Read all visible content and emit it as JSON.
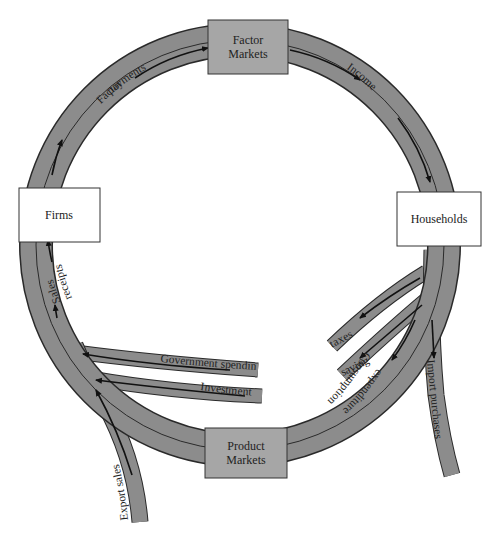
{
  "diagram": {
    "type": "circular-flow",
    "colors": {
      "band": "#8c8c8c",
      "band_outline": "#2a2a2a",
      "market_box": "#a6a6a6",
      "sector_box": "#ffffff",
      "arrow": "#111111"
    },
    "nodes": {
      "factor_markets": {
        "line1": "Factor",
        "line2": "Markets"
      },
      "households": {
        "label": "Households"
      },
      "product_markets": {
        "line1": "Product",
        "line2": "Markets"
      },
      "firms": {
        "label": "Firms"
      }
    },
    "flows": {
      "factor_payments": {
        "line1": "Factor",
        "line2": "payments"
      },
      "income": {
        "label": "Income"
      },
      "taxes": {
        "label": "taxes"
      },
      "saving": {
        "label": "saving"
      },
      "import_purchases": {
        "label": "Import purchases"
      },
      "consumption_expenditure": {
        "line1": "Consumption",
        "line2": "expenditure"
      },
      "government_spending": {
        "label": "Government spending"
      },
      "investment": {
        "label": "Investment"
      },
      "export_sales": {
        "label": "Export sales"
      },
      "sales_receipts": {
        "line1": "Sales",
        "line2": "receipts"
      }
    }
  }
}
